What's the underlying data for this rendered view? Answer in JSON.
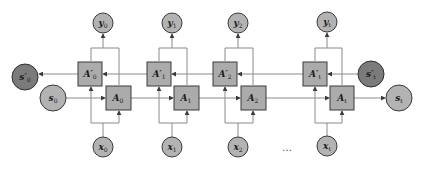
{
  "diagram": {
    "type": "bidirectional-rnn-unrolled",
    "colors": {
      "light_node": "#b3b3b3",
      "dark_node": "#7b7b7b",
      "box": "#ababab",
      "border": "#3a3a3a",
      "edge": "#8a8a8a"
    },
    "steps": [
      {
        "index": "0",
        "forward_cell": "A",
        "backward_cell": "A′",
        "input": "x",
        "output": "y"
      },
      {
        "index": "1",
        "forward_cell": "A",
        "backward_cell": "A′",
        "input": "x",
        "output": "y"
      },
      {
        "index": "2",
        "forward_cell": "A",
        "backward_cell": "A′",
        "input": "x",
        "output": "y"
      },
      {
        "index": "t",
        "forward_cell": "A",
        "backward_cell": "A′",
        "input": "x",
        "output": "y"
      }
    ],
    "states": {
      "forward_initial": {
        "base": "s",
        "sub": "0"
      },
      "forward_final": {
        "base": "s",
        "sub": "t"
      },
      "backward_initial": {
        "base": "s′",
        "sub": "t"
      },
      "backward_final": {
        "base": "s′",
        "sub": "0"
      }
    },
    "ellipsis": "…"
  }
}
